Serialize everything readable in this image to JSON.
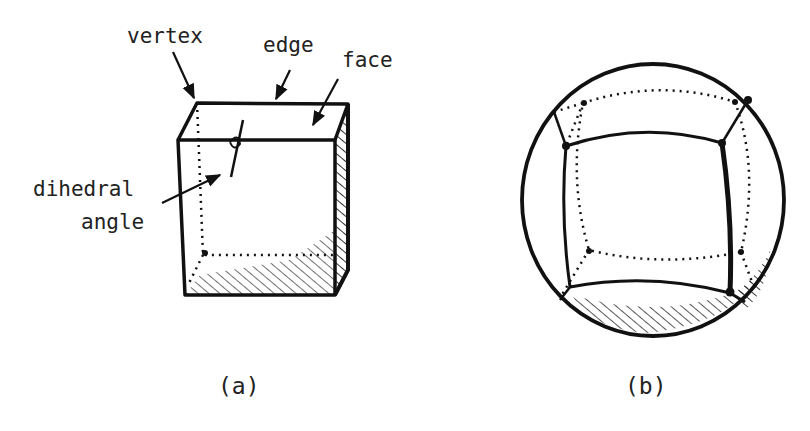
{
  "diagram": {
    "panel_a": {
      "caption": "(a)",
      "subject": "cube",
      "labels": {
        "vertex": "vertex",
        "edge": "edge",
        "face": "face",
        "dihedral_line1": "dihedral",
        "dihedral_line2": "angle"
      }
    },
    "panel_b": {
      "caption": "(b)",
      "subject": "spherical cube (cube projected onto sphere)"
    },
    "colors": {
      "ink": "#111111",
      "background": "#ffffff"
    }
  }
}
